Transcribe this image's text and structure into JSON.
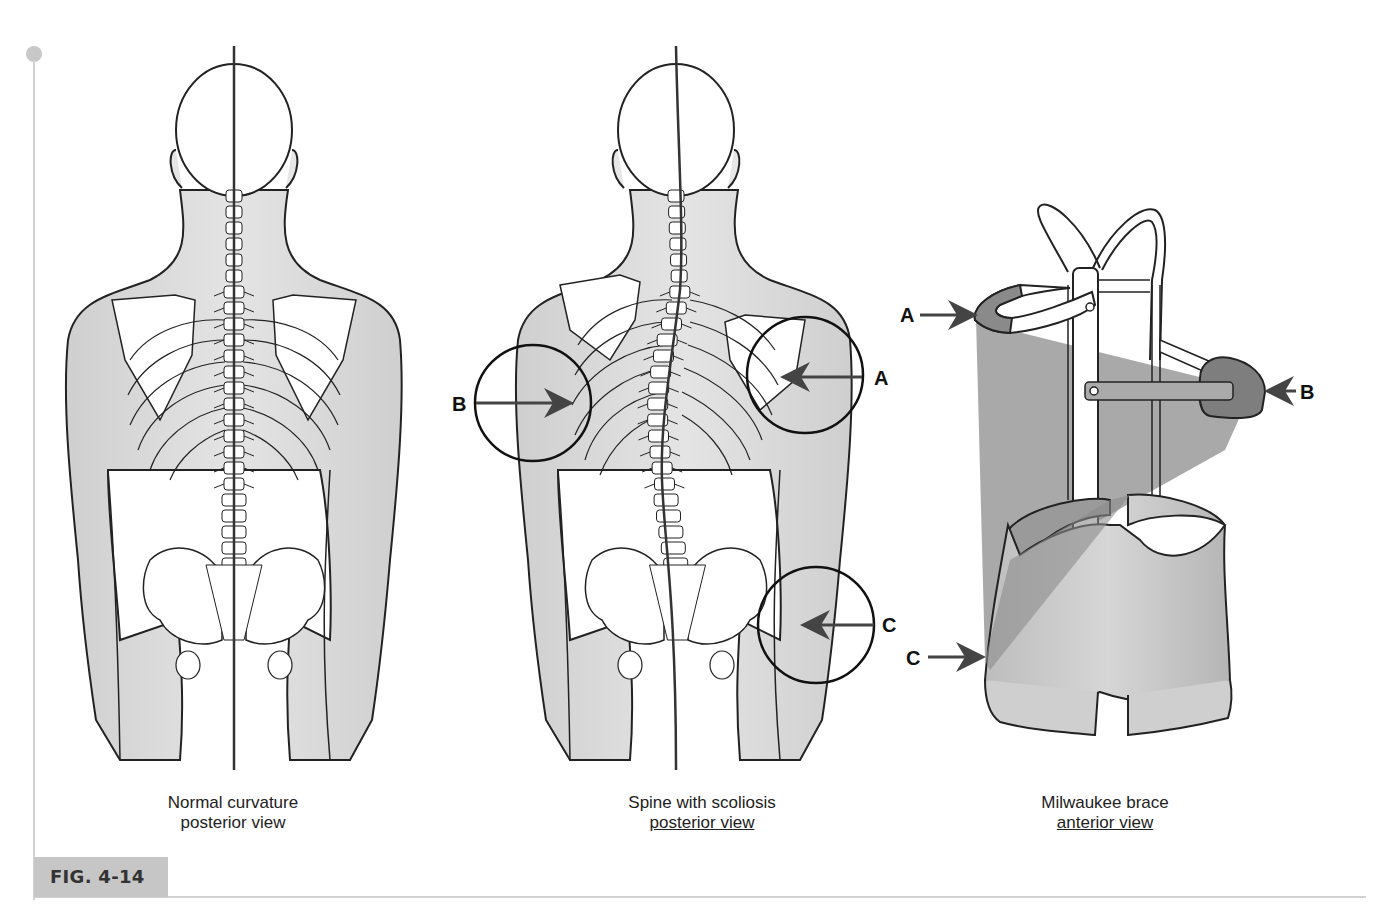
{
  "figure": {
    "label": "FIG. 4-14",
    "panels": [
      {
        "id": "normal",
        "caption_line1": "Normal curvature",
        "caption_line2": "posterior view",
        "line2_underlined": false
      },
      {
        "id": "scoliosis",
        "caption_line1": "Spine with scoliosis",
        "caption_line2": "posterior view",
        "line2_underlined": true,
        "markers": [
          {
            "letter": "A",
            "side": "right"
          },
          {
            "letter": "B",
            "side": "left"
          },
          {
            "letter": "C",
            "side": "right"
          }
        ]
      },
      {
        "id": "brace",
        "caption_line1": "Milwaukee brace",
        "caption_line2": "anterior view",
        "line2_underlined": true,
        "markers": [
          {
            "letter": "A",
            "side": "left"
          },
          {
            "letter": "B",
            "side": "right"
          },
          {
            "letter": "C",
            "side": "left"
          }
        ]
      }
    ]
  },
  "colors": {
    "skin": "#d9d9d9",
    "bone": "#ffffff",
    "outline": "#222222",
    "arrow": "#444444",
    "brace_shade": "#8c8c8c",
    "fig_tab": "#c6c6c6"
  }
}
